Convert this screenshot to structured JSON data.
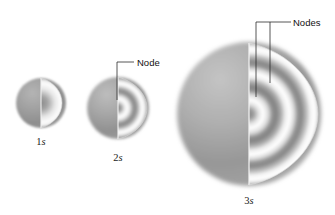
{
  "figure": {
    "kind": "orbital-electron-density-diagram",
    "background_color": "#ffffff",
    "ink_color": "#1a1a1a",
    "shell_color_dark": "#8f8f8f",
    "shell_color_light": "#ffffff"
  },
  "orbitals": [
    {
      "id": "1s",
      "label_n": "1",
      "label_sub": "s",
      "label_text": "1s",
      "center_x": 41,
      "center_y": 103,
      "radius": 25,
      "node_count": 0,
      "label_x": 41,
      "label_y": 145
    },
    {
      "id": "2s",
      "label_n": "2",
      "label_sub": "s",
      "label_text": "2s",
      "center_x": 118,
      "center_y": 108,
      "radius": 31,
      "node_count": 1,
      "label_x": 118,
      "label_y": 161
    },
    {
      "id": "3s",
      "label_n": "3",
      "label_sub": "s",
      "label_text": "3s",
      "center_x": 249,
      "center_y": 114,
      "radius": 72,
      "node_count": 2,
      "label_x": 249,
      "label_y": 204
    }
  ],
  "annotations": [
    {
      "id": "node-2s",
      "text": "Node",
      "text_x": 137,
      "text_y": 66,
      "leader": "M117,100 L117,62 L134,62",
      "target_orbital": "2s",
      "pointer_count": 1
    },
    {
      "id": "nodes-3s",
      "text": "Nodes",
      "text_x": 293,
      "text_y": 26,
      "leader": "M256,97 L256,22 L291,22 M270,83 L270,22",
      "target_orbital": "3s",
      "pointer_count": 2
    }
  ]
}
